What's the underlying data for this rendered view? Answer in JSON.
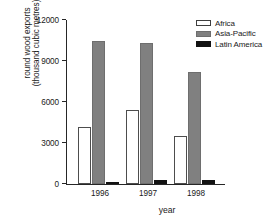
{
  "chart_data": {
    "type": "bar",
    "title": "",
    "xlabel": "year",
    "ylabel_line1": "round wood exports",
    "ylabel_line2": "(thousand cubic metres)",
    "categories": [
      "1996",
      "1997",
      "1998"
    ],
    "series": [
      {
        "name": "Africa",
        "color": "#ffffff",
        "values": [
          4170,
          5420,
          3480
        ]
      },
      {
        "name": "Asia-Pacific",
        "color": "#808080",
        "values": [
          10450,
          10320,
          8200
        ]
      },
      {
        "name": "Latin America",
        "color": "#121212",
        "values": [
          60,
          310,
          300
        ]
      }
    ],
    "ylim": [
      0,
      12000
    ],
    "yticks": [
      0,
      3000,
      6000,
      9000,
      12000
    ],
    "ytick_labels": [
      "0",
      "3000",
      "6000",
      "9000",
      "12000"
    ],
    "grid": false,
    "legend_position": "top-right"
  }
}
